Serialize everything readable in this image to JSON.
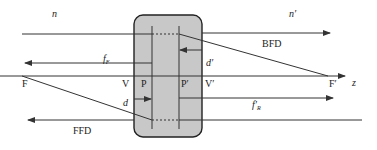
{
  "diagram": {
    "colors": {
      "line": "#333333",
      "box_fill": "#c8c8c8",
      "box_stroke": "#222222",
      "background": "#ffffff"
    },
    "media": {
      "object_index": "n",
      "image_index": "n′"
    },
    "points": {
      "front_focal": "F",
      "rear_focal": "F′",
      "front_vertex": "V",
      "rear_vertex": "V′",
      "front_principal": "P",
      "rear_principal": "P′"
    },
    "axis_label": "z",
    "distances": {
      "front_focal_length": {
        "main": "f",
        "sub": "F"
      },
      "rear_focal_length": {
        "main": "f′",
        "sub": "R"
      },
      "back_focal_distance": "BFD",
      "front_focal_distance": "FFD",
      "front_principal_offset": "d",
      "rear_principal_offset": "d′"
    }
  }
}
